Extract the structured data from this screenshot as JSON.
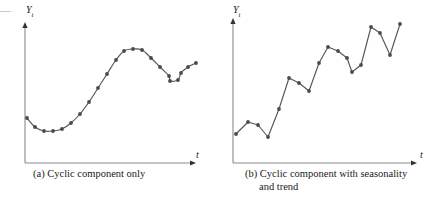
{
  "figure": {
    "background_color": "#ffffff",
    "ink_color": "#555555",
    "axis_color": "#8a8a8a",
    "marker_color": "#4a4a4a"
  },
  "panels": [
    {
      "id": "a",
      "caption": "(a) Cyclic component only",
      "caption_line1": "(a) Cyclic component only",
      "caption_line2": "",
      "y_axis_label": "Y",
      "y_axis_subscript": "t",
      "x_axis_label": "t",
      "axis": {
        "origin_x": 25,
        "origin_y": 163,
        "y_top": 22,
        "x_right": 196
      }
    },
    {
      "id": "b",
      "caption": "(b) Cyclic component with seasonality and trend",
      "caption_line1": "(b) Cyclic component with seasonality",
      "caption_line2": "and trend",
      "y_axis_label": "Y",
      "y_axis_subscript": "t",
      "x_axis_label": "t",
      "axis": {
        "origin_x": 12,
        "origin_y": 163,
        "y_top": 18,
        "x_right": 196
      }
    }
  ],
  "chart_data": [
    {
      "type": "line",
      "title": "(a) Cyclic component only",
      "xlabel": "t",
      "ylabel": "Y_t",
      "grid": false,
      "legend": "none",
      "axis_arrows": true,
      "smoothed": true,
      "xlim": [
        0,
        22
      ],
      "ylim": [
        0,
        10
      ],
      "x": [
        0,
        1,
        2,
        3,
        4,
        5,
        6,
        7,
        8,
        9,
        10,
        11,
        12,
        13,
        14,
        15,
        16,
        17,
        18,
        19,
        20,
        21
      ],
      "y": [
        3.45,
        3.0,
        2.72,
        2.7,
        2.78,
        3.1,
        3.58,
        4.28,
        5.05,
        5.85,
        6.62,
        7.25,
        7.4,
        7.35,
        6.85,
        6.35,
        5.85,
        5.55,
        5.62,
        6.0,
        6.35,
        6.55
      ],
      "pixel_points": [
        [
          27,
          118
        ],
        [
          35,
          127
        ],
        [
          44,
          131
        ],
        [
          53,
          131
        ],
        [
          62,
          129
        ],
        [
          71,
          123
        ],
        [
          80,
          114
        ],
        [
          89,
          102
        ],
        [
          98,
          88
        ],
        [
          107,
          74
        ],
        [
          116,
          60
        ],
        [
          124,
          51
        ],
        [
          133,
          49
        ],
        [
          142,
          50
        ],
        [
          151,
          58
        ],
        [
          160,
          67
        ],
        [
          169,
          76
        ],
        [
          170,
          81
        ],
        [
          178,
          80
        ],
        [
          181,
          73
        ],
        [
          188,
          67
        ],
        [
          196,
          63
        ]
      ]
    },
    {
      "type": "line",
      "title": "(b) Cyclic component with seasonality and trend",
      "xlabel": "t",
      "ylabel": "Y_t",
      "grid": false,
      "legend": "none",
      "axis_arrows": true,
      "smoothed": false,
      "xlim": [
        0,
        22
      ],
      "ylim": [
        0,
        10
      ],
      "x": [
        0,
        1,
        2,
        3,
        4,
        5,
        6,
        7,
        8,
        9,
        10,
        11,
        12,
        13,
        14,
        15,
        16,
        17,
        18,
        19,
        20,
        21
      ],
      "y": [
        2.6,
        3.35,
        3.18,
        2.52,
        4.32,
        6.05,
        5.72,
        5.35,
        7.05,
        8.25,
        7.92,
        7.55,
        8.65,
        9.55,
        9.25,
        8.2,
        9.0
      ],
      "pixel_points": [
        [
          15,
          134
        ],
        [
          27,
          122
        ],
        [
          37,
          125
        ],
        [
          47,
          137
        ],
        [
          58,
          109
        ],
        [
          68,
          78
        ],
        [
          78,
          83
        ],
        [
          88,
          91
        ],
        [
          98,
          63
        ],
        [
          107,
          47
        ],
        [
          117,
          51
        ],
        [
          126,
          58
        ],
        [
          131,
          72
        ],
        [
          140,
          65
        ],
        [
          150,
          27
        ],
        [
          159,
          33
        ],
        [
          169,
          55
        ],
        [
          179,
          24
        ]
      ]
    }
  ]
}
